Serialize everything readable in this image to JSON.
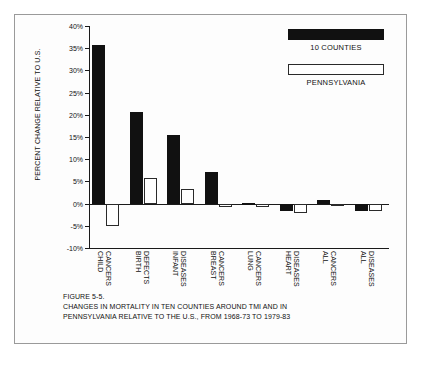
{
  "figure": {
    "label": "FIGURE 5-5.",
    "caption_line_1": "CHANGES IN MORTALITY IN TEN COUNTIES AROUND TMI AND IN",
    "caption_line_2": "PENNSYLVANIA RELATIVE TO THE U.S., FROM 1968-73 TO 1979-83"
  },
  "legend": {
    "items": [
      {
        "label": "10 COUNTIES",
        "color": "#111111",
        "swatch": "filled"
      },
      {
        "label": "PENNSYLVANIA",
        "color": "#ffffff",
        "swatch": "outline"
      }
    ]
  },
  "colors": {
    "counties": "#111111",
    "pennsylvania": "#ffffff",
    "axis": "#1a1a1a",
    "frame": "#9a9a9a",
    "background": "#fdfdfd"
  },
  "chart_data": {
    "type": "bar",
    "title": "",
    "xlabel": "",
    "ylabel": "PERCENT CHANGE RELATIVE TO U.S.",
    "ylim": [
      -10,
      40
    ],
    "ytick_step": 5,
    "ytick_labels": [
      "40%",
      "35%",
      "30%",
      "25%",
      "20%",
      "15%",
      "10%",
      "5%",
      "0%",
      "-5%",
      "-10%"
    ],
    "ytick_values": [
      40,
      35,
      30,
      25,
      20,
      15,
      10,
      5,
      0,
      -5,
      -10
    ],
    "grid": false,
    "legend_position": "top-right",
    "categories": [
      "CHILD CANCERS",
      "BIRTH DEFECTS",
      "INFANT DISEASES",
      "BREAST CANCERS",
      "LUNG CANCERS",
      "HEART DISEASES",
      "ALL CANCERS",
      "ALL DISEASES"
    ],
    "category_lines": [
      [
        "CHILD",
        "CANCERS"
      ],
      [
        "BIRTH",
        "DEFECTS"
      ],
      [
        "INFANT",
        "DISEASES"
      ],
      [
        "BREAST",
        "CANCERS"
      ],
      [
        "LUNG",
        "CANCERS"
      ],
      [
        "HEART",
        "DISEASES"
      ],
      [
        "ALL",
        "CANCERS"
      ],
      [
        "ALL",
        "DISEASES"
      ]
    ],
    "series": [
      {
        "name": "10 COUNTIES",
        "values": [
          35.7,
          20.7,
          15.4,
          7.1,
          0.1,
          -1.6,
          0.7,
          -1.7
        ]
      },
      {
        "name": "PENNSYLVANIA",
        "values": [
          -5.0,
          5.7,
          3.4,
          -0.8,
          -0.8,
          -2.1,
          -0.1,
          -1.6
        ]
      }
    ]
  }
}
